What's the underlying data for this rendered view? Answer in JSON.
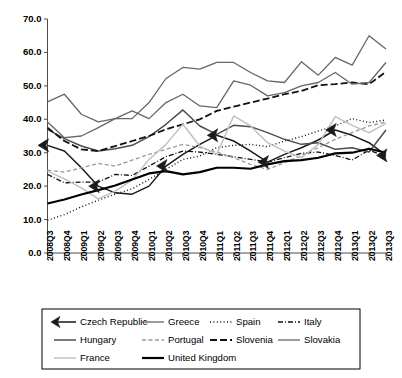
{
  "chart_data": {
    "type": "line",
    "title": "",
    "subtitle": "",
    "xlabel": "",
    "ylabel": "",
    "grid": false,
    "legend_position": "bottom",
    "ylim": [
      0.0,
      70.0
    ],
    "ytick_labels": [
      "0.0",
      "10.0",
      "20.0",
      "30.0",
      "40.0",
      "50.0",
      "60.0",
      "70.0"
    ],
    "ytick_values": [
      0.0,
      10.0,
      20.0,
      30.0,
      40.0,
      50.0,
      60.0,
      70.0
    ],
    "categories": [
      "2008Q3",
      "2008Q4",
      "2009Q1",
      "2009Q2",
      "2009Q3",
      "2009Q4",
      "2010Q1",
      "2010Q2",
      "2010Q3",
      "2010Q4",
      "2011Q1",
      "2011Q2",
      "2011Q3",
      "2011Q4",
      "2012Q1",
      "2012Q2",
      "2012Q3",
      "2012Q4",
      "2013Q1",
      "2013Q2",
      "2013Q3"
    ],
    "series": [
      {
        "name": "Czech Republic",
        "color": "#1a1a1a",
        "width": 1.5,
        "dash": "none",
        "marker": "left-arrow",
        "values": [
          32.2,
          30.5,
          25.5,
          20.0,
          18.0,
          17.6,
          20.0,
          26.0,
          29.5,
          32.5,
          35.2,
          33.5,
          30.5,
          27.2,
          29.5,
          31.5,
          33.8,
          36.8,
          35.2,
          33.0,
          29.2
        ]
      },
      {
        "name": "Greece",
        "color": "#666666",
        "width": 1.3,
        "dash": "none",
        "marker": "none",
        "values": [
          45.2,
          47.5,
          41.5,
          39.2,
          40.2,
          40.2,
          45.0,
          52.2,
          55.5,
          55.0,
          57.0,
          57.0,
          54.0,
          51.5,
          51.0,
          57.2,
          53.2,
          58.5,
          56.2,
          65.0,
          61.0
        ]
      },
      {
        "name": "Spain",
        "color": "#111111",
        "width": 1.4,
        "dash": "1,2.4",
        "marker": "none",
        "values": [
          9.8,
          11.5,
          13.8,
          15.8,
          17.6,
          19.2,
          22.0,
          25.0,
          28.0,
          29.0,
          31.5,
          32.2,
          32.5,
          31.8,
          33.5,
          34.8,
          36.5,
          38.0,
          40.2,
          39.0,
          39.8
        ]
      },
      {
        "name": "Italy",
        "color": "#111111",
        "width": 1.3,
        "dash": "5,2,1,2",
        "marker": "none",
        "values": [
          23.5,
          21.0,
          21.2,
          21.2,
          23.5,
          23.2,
          26.0,
          28.8,
          30.5,
          30.2,
          29.5,
          28.8,
          28.0,
          27.2,
          28.5,
          29.8,
          30.2,
          29.2,
          27.8,
          30.8,
          28.8
        ]
      },
      {
        "name": "Hungary",
        "color": "#4d4d4d",
        "width": 1.5,
        "dash": "none",
        "marker": "none",
        "values": [
          37.0,
          34.2,
          32.0,
          30.5,
          31.2,
          32.2,
          34.8,
          38.5,
          42.8,
          38.0,
          35.5,
          38.2,
          37.8,
          36.0,
          34.0,
          32.5,
          33.0,
          31.0,
          31.5,
          30.2,
          36.8
        ]
      },
      {
        "name": "Portugal",
        "color": "#999999",
        "width": 1.3,
        "dash": "4,2.5",
        "marker": "none",
        "values": [
          24.8,
          24.2,
          25.5,
          26.8,
          26.0,
          27.8,
          29.5,
          31.0,
          32.5,
          31.5,
          30.2,
          28.5,
          26.5,
          25.0,
          27.0,
          29.2,
          31.5,
          34.0,
          36.0,
          38.0,
          39.2
        ]
      },
      {
        "name": "Slovenia",
        "color": "#111111",
        "width": 1.8,
        "dash": "7,3",
        "marker": "none",
        "values": [
          37.5,
          33.5,
          31.0,
          30.5,
          32.0,
          33.5,
          35.0,
          37.0,
          38.5,
          40.0,
          42.5,
          43.8,
          45.0,
          46.2,
          47.5,
          48.5,
          50.2,
          50.5,
          51.0,
          50.5,
          54.2
        ]
      },
      {
        "name": "Slovakia",
        "color": "#666666",
        "width": 1.3,
        "dash": "none",
        "marker": "none",
        "values": [
          39.2,
          34.5,
          35.0,
          37.5,
          40.2,
          42.5,
          40.2,
          45.0,
          47.5,
          44.0,
          43.5,
          51.5,
          50.2,
          47.0,
          48.0,
          50.0,
          51.0,
          54.0,
          50.5,
          51.0,
          57.0
        ]
      },
      {
        "name": "France",
        "color": "#bfbfbf",
        "width": 1.4,
        "dash": "none",
        "marker": "none",
        "values": [
          24.5,
          22.2,
          19.5,
          16.2,
          18.5,
          21.8,
          28.0,
          32.5,
          38.5,
          32.0,
          29.5,
          41.0,
          38.0,
          33.0,
          30.5,
          28.5,
          32.5,
          40.8,
          38.2,
          36.0,
          38.8
        ]
      },
      {
        "name": "United Kingdom",
        "color": "#000000",
        "width": 2.2,
        "dash": "none",
        "marker": "none",
        "values": [
          14.8,
          16.0,
          17.5,
          18.8,
          20.2,
          22.0,
          23.8,
          24.5,
          23.5,
          24.2,
          25.5,
          25.5,
          25.2,
          26.5,
          27.5,
          27.8,
          28.5,
          29.8,
          30.0,
          31.2,
          30.0
        ]
      }
    ],
    "marker_points": {
      "Czech Republic": [
        0,
        3,
        7,
        10,
        13,
        17,
        20
      ]
    }
  },
  "legend": {
    "rows": [
      [
        "Czech Republic",
        "Greece",
        "Spain",
        "Italy"
      ],
      [
        "Hungary",
        "Portugal",
        "Slovenia",
        "Slovakia"
      ],
      [
        "France",
        "United Kingdom"
      ]
    ]
  }
}
